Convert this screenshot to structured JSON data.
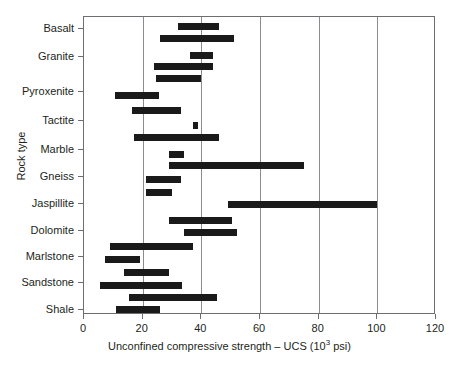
{
  "chart_data": {
    "type": "bar",
    "orientation": "horizontal",
    "style": "floating range bars",
    "title": "",
    "xlabel": "Unconfined compressive strength – UCS (10³ psi)",
    "xlabel_prefix": "Unconfined compressive strength – UCS (10",
    "xlabel_sup": "3",
    "xlabel_suffix": " psi)",
    "ylabel": "Rock type",
    "xlim": [
      0,
      120
    ],
    "xticks": [
      0,
      20,
      40,
      60,
      80,
      100,
      120
    ],
    "xticklabels": [
      "0",
      "20",
      "40",
      "60",
      "80",
      "100",
      "120"
    ],
    "grid": "vertical gridlines at x ticks",
    "legend": "none",
    "bar_color": "#1a1a1a",
    "categories": [
      "Basalt",
      "Granite",
      "Pyroxenite",
      "Tactite",
      "Marble",
      "Gneiss",
      "Jaspillite",
      "Dolomite",
      "Marlstone",
      "Sandstone",
      "Shale"
    ],
    "ranges": [
      {
        "category": "Basalt",
        "low": 32,
        "high": 46
      },
      {
        "category": "Basalt",
        "low": 26,
        "high": 51
      },
      {
        "category": "Granite",
        "low": 36,
        "high": 44
      },
      {
        "category": "Granite",
        "low": 24,
        "high": 44
      },
      {
        "category": "Granite",
        "low": 24.5,
        "high": 40
      },
      {
        "category": "Pyroxenite",
        "low": 10.5,
        "high": 25.5
      },
      {
        "category": "Pyroxenite",
        "low": 16.5,
        "high": 33
      },
      {
        "category": "Tactite",
        "low": 37,
        "high": 39
      },
      {
        "category": "Tactite",
        "low": 17,
        "high": 46
      },
      {
        "category": "Marble",
        "low": 29,
        "high": 34
      },
      {
        "category": "Marble",
        "low": 29,
        "high": 75
      },
      {
        "category": "Gneiss",
        "low": 21,
        "high": 33
      },
      {
        "category": "Gneiss",
        "low": 21,
        "high": 30
      },
      {
        "category": "Jaspillite",
        "low": 49,
        "high": 100
      },
      {
        "category": "Dolomite",
        "low": 29,
        "high": 50.5
      },
      {
        "category": "Dolomite",
        "low": 34,
        "high": 52
      },
      {
        "category": "Marlstone",
        "low": 9,
        "high": 37
      },
      {
        "category": "Marlstone",
        "low": 7,
        "high": 19
      },
      {
        "category": "Sandstone",
        "low": 13.5,
        "high": 29
      },
      {
        "category": "Sandstone",
        "low": 5.5,
        "high": 33.5
      },
      {
        "category": "Shale",
        "low": 15.5,
        "high": 45.5
      },
      {
        "category": "Shale",
        "low": 11,
        "high": 26
      }
    ],
    "bar_pixel_rows": [
      {
        "label": "Basalt",
        "top": 22,
        "low": 32,
        "high": 46
      },
      {
        "label": "Basalt",
        "top": 34,
        "low": 26,
        "high": 51
      },
      {
        "label": "Granite",
        "top": 51,
        "low": 36,
        "high": 44
      },
      {
        "label": "Granite",
        "top": 62,
        "low": 24,
        "high": 44
      },
      {
        "label": "Granite",
        "top": 74,
        "low": 24.5,
        "high": 40
      },
      {
        "label": "Pyroxenite",
        "top": 91,
        "low": 10.5,
        "high": 25.5
      },
      {
        "label": "Pyroxenite",
        "top": 106,
        "low": 16.5,
        "high": 33
      },
      {
        "label": "Tactite",
        "top": 121,
        "low": 37,
        "high": 39
      },
      {
        "label": "Tactite",
        "top": 133,
        "low": 17,
        "high": 46
      },
      {
        "label": "Marble",
        "top": 150,
        "low": 29,
        "high": 34
      },
      {
        "label": "Marble",
        "top": 161,
        "low": 29,
        "high": 75
      },
      {
        "label": "Gneiss",
        "top": 175,
        "low": 21,
        "high": 33
      },
      {
        "label": "Gneiss",
        "top": 188,
        "low": 21,
        "high": 30
      },
      {
        "label": "Jaspillite",
        "top": 200,
        "low": 49,
        "high": 100
      },
      {
        "label": "Dolomite",
        "top": 216,
        "low": 29,
        "high": 50.5
      },
      {
        "label": "Dolomite",
        "top": 228,
        "low": 34,
        "high": 52
      },
      {
        "label": "Marlstone",
        "top": 242,
        "low": 9,
        "high": 37
      },
      {
        "label": "Marlstone",
        "top": 255,
        "low": 7,
        "high": 19
      },
      {
        "label": "Sandstone",
        "top": 268,
        "low": 13.5,
        "high": 29
      },
      {
        "label": "Sandstone",
        "top": 281,
        "low": 5.5,
        "high": 33.5
      },
      {
        "label": "Shale",
        "top": 293,
        "low": 15.5,
        "high": 45.5
      },
      {
        "label": "Shale",
        "top": 305,
        "low": 11,
        "high": 26
      }
    ],
    "ytick_pixel_rows": [
      {
        "label": "Basalt",
        "y": 28
      },
      {
        "label": "Granite",
        "y": 56
      },
      {
        "label": "Pyroxenite",
        "y": 91
      },
      {
        "label": "Tactite",
        "y": 120
      },
      {
        "label": "Marble",
        "y": 149
      },
      {
        "label": "Gneiss",
        "y": 176
      },
      {
        "label": "Jaspillite",
        "y": 203
      },
      {
        "label": "Dolomite",
        "y": 230
      },
      {
        "label": "Marlstone",
        "y": 256
      },
      {
        "label": "Sandstone",
        "y": 282
      },
      {
        "label": "Shale",
        "y": 309
      }
    ]
  }
}
